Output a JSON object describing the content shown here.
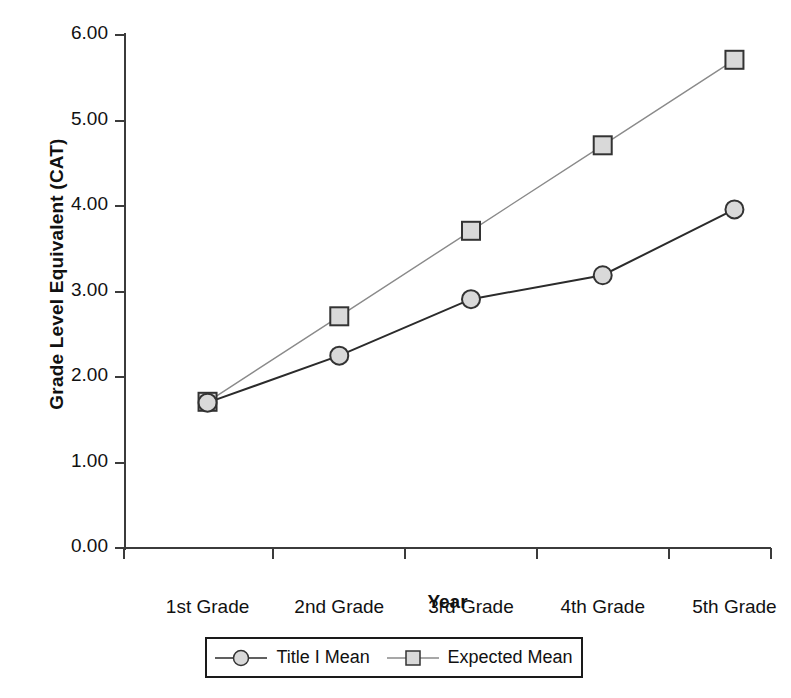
{
  "chart_data": {
    "type": "line",
    "title": "",
    "xlabel": "Year",
    "ylabel": "Grade Level Equivalent (CAT)",
    "categories": [
      "1st Grade",
      "2nd Grade",
      "3rd Grade",
      "4th Grade",
      "5th Grade"
    ],
    "ylim": [
      0.0,
      6.0
    ],
    "ytick_labels": [
      "0.00",
      "1.00",
      "2.00",
      "3.00",
      "4.00",
      "5.00",
      "6.00"
    ],
    "ytick_values": [
      0.0,
      1.0,
      2.0,
      3.0,
      4.0,
      5.0,
      6.0
    ],
    "grid": false,
    "legend_position": "below-plot",
    "series": [
      {
        "name": "Title I Mean",
        "marker": "circle",
        "marker_fill": "#d9d9d9",
        "marker_edge": "#333333",
        "line_color": "#2b2b2b",
        "values": [
          1.7,
          2.25,
          2.91,
          3.19,
          3.96
        ]
      },
      {
        "name": "Expected Mean",
        "marker": "square",
        "marker_fill": "#d9d9d9",
        "marker_edge": "#333333",
        "line_color": "#8a8a8a",
        "values": [
          1.71,
          2.71,
          3.71,
          4.71,
          5.71
        ]
      }
    ]
  },
  "axis": {
    "y_title": "Grade Level Equivalent (CAT)",
    "x_title": "Year"
  },
  "legend": {
    "entries": [
      {
        "label": "Title I Mean",
        "marker": "circle-marker"
      },
      {
        "label": "Expected Mean",
        "marker": "square-marker"
      }
    ]
  }
}
